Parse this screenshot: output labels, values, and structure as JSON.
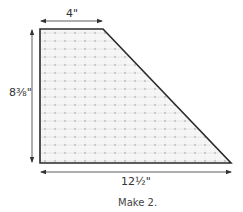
{
  "diagram": {
    "shape": "right-trapezoid",
    "fill_pattern": "light-gray-dotted-grid",
    "colors": {
      "outline": "#2a2a2a",
      "fill": "#f4f4f4",
      "grid": "#d6d6d6",
      "dot": "#bdbdbd",
      "dimension_line": "#333333"
    },
    "dimensions": {
      "top": "4\"",
      "left": "8⅜\"",
      "bottom": "12½\""
    },
    "caption": "Make 2."
  }
}
